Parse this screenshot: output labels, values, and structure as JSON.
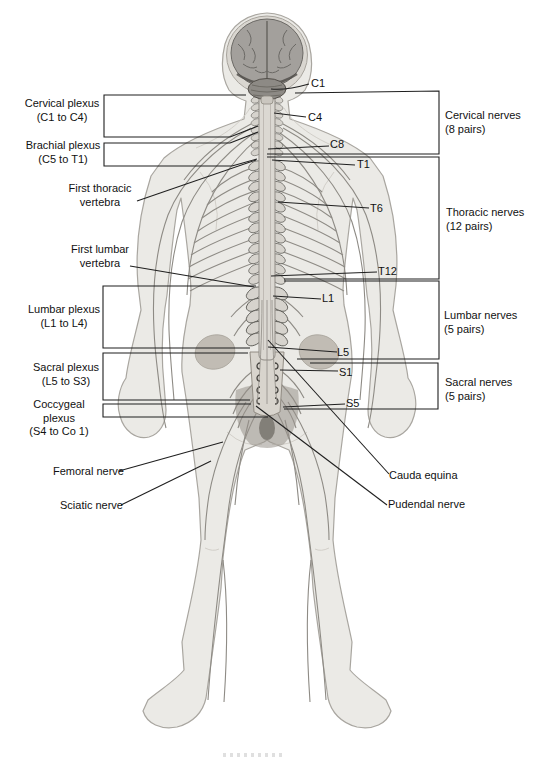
{
  "plexus_labels": [
    {
      "name": "cervical-plexus",
      "line1": "Cervical plexus",
      "line2": "(C1 to C4)"
    },
    {
      "name": "brachial-plexus",
      "line1": "Brachial plexus",
      "line2": "(C5 to T1)"
    },
    {
      "name": "first-thoracic-vertebra",
      "line1": "First thoracic",
      "line2": "vertebra"
    },
    {
      "name": "first-lumbar-vertebra",
      "line1": "First lumbar",
      "line2": "vertebra"
    },
    {
      "name": "lumbar-plexus",
      "line1": "Lumbar plexus",
      "line2": "(L1 to L4)"
    },
    {
      "name": "sacral-plexus",
      "line1": "Sacral plexus",
      "line2": "(L5 to S3)"
    },
    {
      "name": "coccygeal-plexus",
      "line1": "Coccygeal plexus",
      "line2": "(S4 to Co 1)"
    },
    {
      "name": "femoral-nerve",
      "line1": "Femoral nerve"
    },
    {
      "name": "sciatic-nerve",
      "line1": "Sciatic nerve"
    }
  ],
  "vertebra_markers": [
    "C1",
    "C4",
    "C8",
    "T1",
    "T6",
    "T12",
    "L1",
    "L5",
    "S1",
    "S5"
  ],
  "nerve_group_labels": [
    {
      "name": "cervical-nerves",
      "line1": "Cervical nerves",
      "line2": "(8 pairs)"
    },
    {
      "name": "thoracic-nerves",
      "line1": "Thoracic nerves",
      "line2": "(12 pairs)"
    },
    {
      "name": "lumbar-nerves",
      "line1": "Lumbar nerves",
      "line2": "(5 pairs)"
    },
    {
      "name": "sacral-nerves",
      "line1": "Sacral nerves",
      "line2": "(5 pairs)"
    },
    {
      "name": "cauda-equina",
      "line1": "Cauda equina"
    },
    {
      "name": "pudendal-nerve",
      "line1": "Pudendal nerve"
    }
  ],
  "colors": {
    "background": "#ffffff",
    "callout_line": "#1f1f1f",
    "text": "#111111",
    "body_fill": "#ebeae6",
    "body_outline": "#a9a6a0",
    "nerve_line": "#8e8b85",
    "brain_fill": "#a3a09c",
    "cerebellum_fill": "#8d8a85",
    "spinal_cord_fill": "#dbd8d2",
    "pelvis_shade": "#97928a"
  }
}
